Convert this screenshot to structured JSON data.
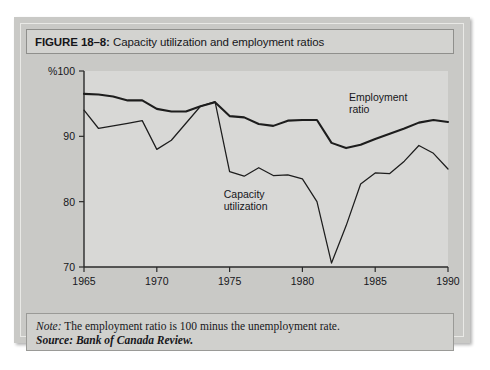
{
  "figure": {
    "number_label": "FIGURE 18–8:",
    "title": " Capacity utilization and employment ratios"
  },
  "note": {
    "keyword": "Note:",
    "text": " The employment ratio is 100 minus the unemployment rate.",
    "source": "Source: Bank of Canada Review."
  },
  "chart_data": {
    "type": "line",
    "title": "Capacity utilization and employment ratios",
    "xlabel": "",
    "ylabel": "%",
    "unit_label": "%",
    "xlim": [
      1965,
      1990
    ],
    "ylim": [
      70,
      100
    ],
    "xticks": [
      1965,
      1970,
      1975,
      1980,
      1985,
      1990
    ],
    "xtick_labels": [
      "1965",
      "1970",
      "1975",
      "1980",
      "1985",
      "1990"
    ],
    "yticks": [
      70,
      80,
      90,
      100
    ],
    "ytick_labels": [
      "70",
      "80",
      "90",
      "100"
    ],
    "grid": false,
    "legend": "inline-annotations",
    "annotations": [
      {
        "name": "employment-ratio-label",
        "line1": "Employment",
        "line2": "ratio",
        "x": 1983.2,
        "y": 95.4
      },
      {
        "name": "capacity-utilization-label",
        "line1": "Capacity",
        "line2": "utilization",
        "x": 1974.6,
        "y": 80.6
      }
    ],
    "x": [
      1965,
      1966,
      1967,
      1968,
      1969,
      1970,
      1971,
      1972,
      1973,
      1974,
      1975,
      1976,
      1977,
      1978,
      1979,
      1980,
      1981,
      1982,
      1983,
      1984,
      1985,
      1986,
      1987,
      1988,
      1989,
      1990
    ],
    "series": [
      {
        "name": "Employment ratio",
        "values": [
          96.5,
          96.4,
          96.1,
          95.5,
          95.5,
          94.2,
          93.8,
          93.8,
          94.6,
          95.2,
          93.1,
          92.9,
          91.9,
          91.6,
          92.4,
          92.5,
          92.5,
          89.0,
          88.2,
          88.7,
          89.6,
          90.4,
          91.2,
          92.1,
          92.5,
          92.2
        ]
      },
      {
        "name": "Capacity utilization",
        "values": [
          94.0,
          91.2,
          91.6,
          92.0,
          92.4,
          88.0,
          89.4,
          92.0,
          94.6,
          95.3,
          84.6,
          83.9,
          85.2,
          84.0,
          84.1,
          83.5,
          80.0,
          70.6,
          76.3,
          82.7,
          84.4,
          84.3,
          86.2,
          88.6,
          87.4,
          85.0
        ]
      }
    ]
  }
}
